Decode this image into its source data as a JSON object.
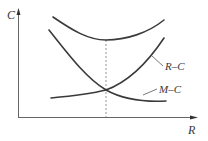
{
  "diagram": {
    "type": "cost-curve-diagram",
    "axes": {
      "y_label": "C",
      "x_label": "R"
    },
    "curves": [
      {
        "id": "total",
        "label": "",
        "shape": "U-shaped total cost curve",
        "min_at_x": "optimum"
      },
      {
        "id": "rc",
        "label": "R–C",
        "shape": "increasing"
      },
      {
        "id": "mc",
        "label": "M–C",
        "shape": "decreasing"
      }
    ],
    "markers": {
      "optimum_line": "dashed vertical line at intersection of R–C and M–C, through minimum of total curve"
    },
    "colors": {
      "line": "#3a3a3a",
      "axis": "#555555",
      "background": "#ffffff"
    }
  }
}
